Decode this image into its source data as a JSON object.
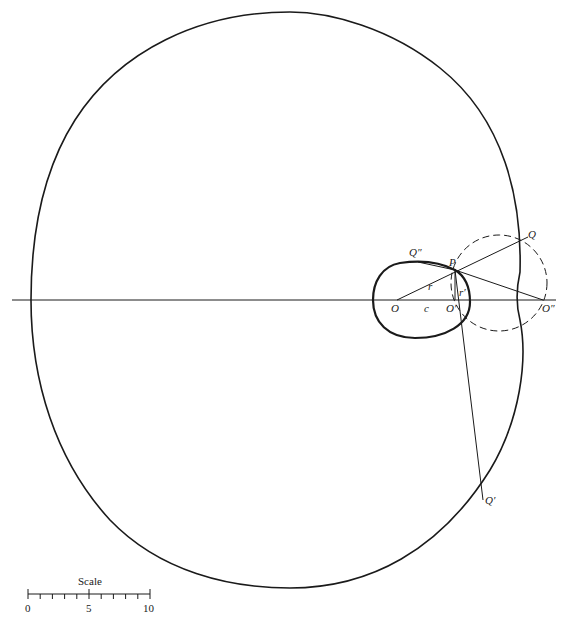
{
  "figure": {
    "points": {
      "O": "O",
      "O_prime": "O′",
      "O_double_prime": "O″",
      "P": "P",
      "Q": "Q",
      "Q_prime": "Q′",
      "Q_double_prime": "Q″"
    },
    "segment_labels": {
      "r": "r",
      "c": "c",
      "r_prime": "r′"
    }
  },
  "scale_bar": {
    "title": "Scale",
    "ticks": [
      "0",
      "5",
      "10"
    ],
    "minor_divisions": 10
  },
  "colors": {
    "ink": "#1a1a1a",
    "background": "#ffffff"
  }
}
